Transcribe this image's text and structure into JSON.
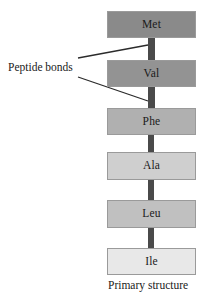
{
  "figure": {
    "caption": "Primary structure",
    "annotation_label": "Peptide bonds",
    "background_color": "#ffffff",
    "bond_color": "#4a4a4a",
    "leader_line_color": "#2b2b2b",
    "box_border_color": "#9a9a9a",
    "text_color": "#1a1a1a"
  },
  "chain": {
    "residues": [
      {
        "label": "Met",
        "fill": "#8a8a8a",
        "x": 107,
        "y": 11,
        "width": 89,
        "height": 27
      },
      {
        "label": "Val",
        "fill": "#939393",
        "x": 107,
        "y": 60,
        "width": 89,
        "height": 27
      },
      {
        "label": "Phe",
        "fill": "#b0b0b0",
        "x": 107,
        "y": 108,
        "width": 89,
        "height": 27
      },
      {
        "label": "Ala",
        "fill": "#cfcfcf",
        "x": 107,
        "y": 152,
        "width": 89,
        "height": 28
      },
      {
        "label": "Leu",
        "fill": "#c0c0c0",
        "x": 107,
        "y": 200,
        "width": 89,
        "height": 28
      },
      {
        "label": "Ile",
        "fill": "#e8e8e8",
        "x": 107,
        "y": 248,
        "width": 89,
        "height": 27
      }
    ],
    "bonds": [
      {
        "from": "Met",
        "to": "Val",
        "x": 148,
        "y": 38,
        "width": 7,
        "height": 22
      },
      {
        "from": "Val",
        "to": "Phe",
        "x": 148,
        "y": 87,
        "width": 7,
        "height": 21
      },
      {
        "from": "Phe",
        "to": "Ala",
        "x": 148,
        "y": 135,
        "width": 6,
        "height": 17
      },
      {
        "from": "Ala",
        "to": "Leu",
        "x": 148,
        "y": 180,
        "width": 6,
        "height": 20
      },
      {
        "from": "Leu",
        "to": "Ile",
        "x": 148,
        "y": 228,
        "width": 6,
        "height": 20
      }
    ]
  },
  "annotations": {
    "peptide_bonds": {
      "text": "Peptide bonds",
      "text_x": 8,
      "text_y": 67,
      "leaders": [
        {
          "x1": 78,
          "y1": 58,
          "x2": 148,
          "y2": 45
        },
        {
          "x1": 78,
          "y1": 77,
          "x2": 148,
          "y2": 101
        }
      ]
    },
    "primary_structure": {
      "text": "Primary structure",
      "text_x": 108,
      "text_y": 283
    }
  }
}
